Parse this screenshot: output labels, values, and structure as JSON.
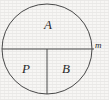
{
  "figure": {
    "kind": "geometry-diagram",
    "background_color": "#f7f6f4",
    "stroke_color": "#4a4a4a",
    "text_color": "#2b2b2b"
  },
  "shapes": {
    "circle": {
      "name": "circle-outline",
      "center_x": 47,
      "center_y": 49,
      "radius": 45,
      "stroke_width": 1
    },
    "diameter": {
      "name": "horizontal-diameter",
      "x1": 2,
      "y1": 49,
      "x2": 94,
      "y2": 49,
      "stroke_width": 1
    },
    "radius": {
      "name": "vertical-radius",
      "x1": 47,
      "y1": 49,
      "x2": 47,
      "y2": 94,
      "stroke_width": 1
    }
  },
  "labels": {
    "upper_region": "A",
    "lower_left_region": "P",
    "lower_right_region": "B",
    "right_edge_point": "m"
  }
}
